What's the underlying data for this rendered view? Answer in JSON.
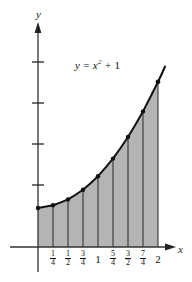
{
  "figure": {
    "background_color": "#ffffff",
    "ink_color": "#111111",
    "shade_color": "#b3b3b3",
    "axis_labels": {
      "x": "x",
      "y": "y"
    },
    "curve_label": {
      "lhs": "y",
      "equals": "=",
      "base": "x",
      "exponent": "2",
      "plus": "+",
      "constant": "1",
      "full": "y = x² + 1"
    }
  },
  "chart_data": {
    "type": "area",
    "title": "",
    "subtitle": "",
    "xlabel": "x",
    "ylabel": "y",
    "function": "y = x^2 + 1",
    "grid": false,
    "legend": null,
    "xlim": [
      -0.15,
      2.3
    ],
    "ylim": [
      -0.35,
      5.9
    ],
    "x_tick_values": [
      0.25,
      0.5,
      0.75,
      1,
      1.25,
      1.5,
      1.75,
      2
    ],
    "x_tick_labels": [
      "1/4",
      "1/2",
      "3/4",
      "1",
      "5/4",
      "3/2",
      "7/4",
      "2"
    ],
    "x_tick_labels_display": [
      {
        "type": "fraction",
        "num": "1",
        "den": "4"
      },
      {
        "type": "fraction",
        "num": "1",
        "den": "2"
      },
      {
        "type": "fraction",
        "num": "3",
        "den": "4"
      },
      {
        "type": "whole",
        "text": "1"
      },
      {
        "type": "fraction",
        "num": "5",
        "den": "4"
      },
      {
        "type": "fraction",
        "num": "3",
        "den": "2"
      },
      {
        "type": "fraction",
        "num": "7",
        "den": "4"
      },
      {
        "type": "whole",
        "text": "2"
      }
    ],
    "y_tick_values": [
      1,
      2,
      3,
      4
    ],
    "y_tick_labels": [
      "",
      "",
      "",
      ""
    ],
    "partition": {
      "a": 0,
      "b": 2,
      "n": 8,
      "delta_x": 0.25,
      "x": [
        0,
        0.25,
        0.5,
        0.75,
        1,
        1.25,
        1.5,
        1.75,
        2
      ],
      "y": [
        1,
        1.0625,
        1.25,
        1.5625,
        2,
        2.5625,
        3.25,
        4.0625,
        5
      ]
    },
    "marked_points": [
      {
        "x": 0,
        "y": 1
      },
      {
        "x": 0.25,
        "y": 1.0625
      },
      {
        "x": 0.5,
        "y": 1.25
      },
      {
        "x": 0.75,
        "y": 1.5625
      },
      {
        "x": 1,
        "y": 2
      },
      {
        "x": 1.25,
        "y": 2.5625
      },
      {
        "x": 1.5,
        "y": 3.25
      },
      {
        "x": 1.75,
        "y": 4.0625
      },
      {
        "x": 2,
        "y": 5
      }
    ],
    "curve_extends_to": {
      "x": 2.12,
      "y": 5.49
    },
    "shaded_region": {
      "from": 0,
      "to": 2,
      "description": "region under y = x^2 + 1 above the x-axis"
    },
    "annotations": [
      {
        "text": "y = x² + 1",
        "x": 0.95,
        "y": 4.6
      }
    ]
  }
}
